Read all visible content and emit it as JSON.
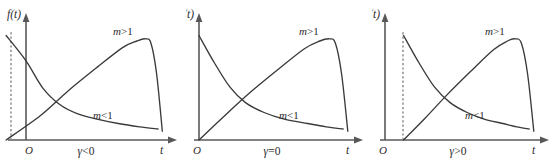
{
  "figure": {
    "title": "",
    "background_color": "#ffffff",
    "curve_color": "#3a3a3c",
    "axis_color": "#58585a",
    "dash_color": "#8d8d90",
    "panel_count": 3
  },
  "chart_data": {
    "type": "line",
    "title": "",
    "xlabel": "t",
    "ylabel": "f(t)",
    "grid": false,
    "legend": "inline-annotations",
    "axis_origin_label": "O",
    "panels": [
      {
        "id": "panel-gamma-negative",
        "condition_label": "γ<0",
        "condition_symbol": "γ",
        "condition_relation": "<",
        "condition_value": "0",
        "y_axis_label": "f(t)",
        "x_axis_label": "t",
        "origin_label": "O",
        "threshold_offset": -0.14,
        "has_threshold_dashline": true,
        "series": [
          {
            "name": "m>1",
            "label": "m>1",
            "m_symbol": "m",
            "m_relation": ">",
            "m_value": "1",
            "shape": "rise-peak-drop",
            "start": [
              -0.14,
              0.0
            ],
            "peak": [
              0.84,
              0.92
            ],
            "end": [
              0.96,
              0.08
            ],
            "x": [
              -0.14,
              0.1,
              0.3,
              0.5,
              0.68,
              0.78,
              0.84,
              0.88,
              0.92,
              0.96
            ],
            "y": [
              0.0,
              0.22,
              0.45,
              0.66,
              0.84,
              0.9,
              0.92,
              0.88,
              0.6,
              0.08
            ]
          },
          {
            "name": "m<1",
            "label": "m<1",
            "m_symbol": "m",
            "m_relation": "<",
            "m_value": "1",
            "shape": "monotone-decay",
            "start": [
              -0.14,
              0.95
            ],
            "end": [
              0.93,
              0.1
            ],
            "x": [
              -0.14,
              0.0,
              0.12,
              0.24,
              0.36,
              0.5,
              0.65,
              0.8,
              0.93
            ],
            "y": [
              0.95,
              0.72,
              0.47,
              0.32,
              0.24,
              0.19,
              0.15,
              0.12,
              0.1
            ]
          }
        ]
      },
      {
        "id": "panel-gamma-zero",
        "condition_label": "γ=0",
        "condition_symbol": "γ",
        "condition_relation": "=",
        "condition_value": "0",
        "y_axis_label": "f(t)",
        "x_axis_label": "t",
        "origin_label": "O",
        "threshold_offset": 0.0,
        "has_threshold_dashline": false,
        "series": [
          {
            "name": "m>1",
            "label": "m>1",
            "m_symbol": "m",
            "m_relation": ">",
            "m_value": "1",
            "shape": "rise-peak-drop",
            "start": [
              0.0,
              0.0
            ],
            "peak": [
              0.84,
              0.92
            ],
            "end": [
              0.96,
              0.08
            ],
            "x": [
              0.0,
              0.15,
              0.32,
              0.5,
              0.68,
              0.78,
              0.84,
              0.88,
              0.92,
              0.96
            ],
            "y": [
              0.0,
              0.2,
              0.42,
              0.63,
              0.83,
              0.9,
              0.92,
              0.88,
              0.6,
              0.08
            ]
          },
          {
            "name": "m<1",
            "label": "m<1",
            "m_symbol": "m",
            "m_relation": "<",
            "m_value": "1",
            "shape": "monotone-decay",
            "start": [
              0.0,
              0.95
            ],
            "end": [
              0.93,
              0.1
            ],
            "x": [
              0.0,
              0.1,
              0.2,
              0.3,
              0.42,
              0.55,
              0.7,
              0.82,
              0.93
            ],
            "y": [
              0.95,
              0.7,
              0.48,
              0.34,
              0.25,
              0.19,
              0.15,
              0.12,
              0.1
            ]
          }
        ]
      },
      {
        "id": "panel-gamma-positive",
        "condition_label": "γ>0",
        "condition_symbol": "γ",
        "condition_relation": ">",
        "condition_value": "0",
        "y_axis_label": "f(t)",
        "x_axis_label": "t",
        "origin_label": "O",
        "threshold_offset": 0.12,
        "has_threshold_dashline": true,
        "series": [
          {
            "name": "m>1",
            "label": "m>1",
            "m_symbol": "m",
            "m_relation": ">",
            "m_value": "1",
            "shape": "rise-peak-drop",
            "start": [
              0.12,
              0.0
            ],
            "peak": [
              0.84,
              0.92
            ],
            "end": [
              0.96,
              0.08
            ],
            "x": [
              0.12,
              0.26,
              0.4,
              0.55,
              0.7,
              0.79,
              0.84,
              0.88,
              0.92,
              0.96
            ],
            "y": [
              0.0,
              0.2,
              0.41,
              0.62,
              0.82,
              0.9,
              0.92,
              0.88,
              0.6,
              0.08
            ]
          },
          {
            "name": "m<1",
            "label": "m<1",
            "m_symbol": "m",
            "m_relation": "<",
            "m_value": "1",
            "shape": "monotone-decay",
            "start": [
              0.12,
              0.95
            ],
            "end": [
              0.93,
              0.1
            ],
            "x": [
              0.12,
              0.22,
              0.32,
              0.42,
              0.53,
              0.64,
              0.76,
              0.85,
              0.93
            ],
            "y": [
              0.95,
              0.7,
              0.48,
              0.34,
              0.25,
              0.19,
              0.15,
              0.12,
              0.1
            ]
          }
        ]
      }
    ]
  }
}
